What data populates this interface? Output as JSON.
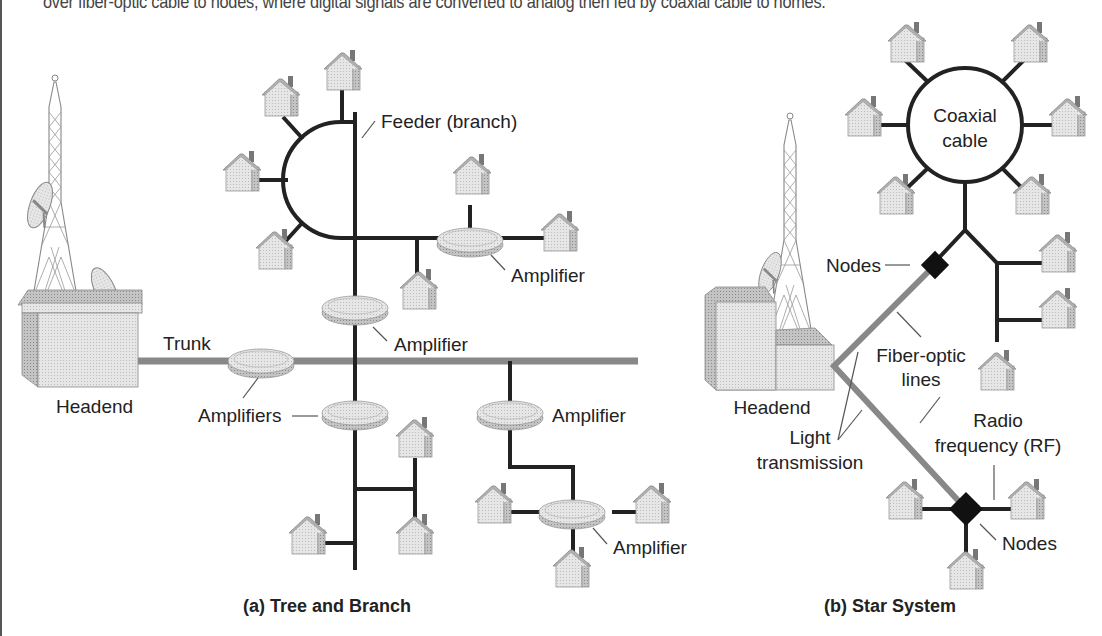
{
  "caption": "over fiber-optic cable to nodes, where digital signals are converted to analog then fed by coaxial cable to homes.",
  "tree_and_branch": {
    "title": "(a) Tree and Branch",
    "labels": {
      "headend": "Headend",
      "trunk": "Trunk",
      "feeder": "Feeder (branch)",
      "amplifiers": "Amplifiers",
      "amplifier_1": "Amplifier",
      "amplifier_2": "Amplifier",
      "amplifier_3": "Amplifier",
      "amplifier_4": "Amplifier"
    }
  },
  "star_system": {
    "title": "(b) Star System",
    "labels": {
      "coaxial_line1": "Coaxial",
      "coaxial_line2": "cable",
      "nodes_top": "Nodes",
      "nodes_bottom": "Nodes",
      "headend": "Headend",
      "fiber_line1": "Fiber-optic",
      "fiber_line2": "lines",
      "light_line1": "Light",
      "light_line2": "transmission",
      "rf_line1": "Radio",
      "rf_line2": "frequency (RF)"
    }
  },
  "colors": {
    "cable": "#222222",
    "fiber": "#888888",
    "node": "#111111",
    "house_fill": "#e4e4e4",
    "amplifier_fill": "#e0e0e0"
  }
}
